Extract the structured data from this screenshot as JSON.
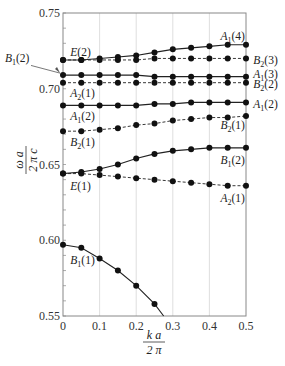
{
  "chart_data": {
    "type": "line",
    "title": "",
    "xlabel": "k a / 2 π",
    "ylabel": "ω a / 2 π c",
    "xlim": [
      0,
      0.5
    ],
    "ylim": [
      0.55,
      0.75
    ],
    "xticks": [
      0,
      0.1,
      0.2,
      0.3,
      0.4,
      0.5
    ],
    "xtick_labels": [
      "0",
      "0.1",
      "0.2",
      "0.3",
      "0.4",
      "0.5"
    ],
    "yticks": [
      0.55,
      0.6,
      0.65,
      0.7,
      0.75
    ],
    "ytick_labels": [
      "0.55",
      "0.60",
      "0.65",
      "0.70",
      "0.75"
    ],
    "grid": "vertical",
    "x": [
      0,
      0.05,
      0.1,
      0.15,
      0.2,
      0.25,
      0.3,
      0.35,
      0.4,
      0.45,
      0.5
    ],
    "series": [
      {
        "name": "A1(4)",
        "start_label": "E(2)",
        "style": "solid",
        "values": [
          0.719,
          0.719,
          0.72,
          0.721,
          0.722,
          0.724,
          0.726,
          0.727,
          0.728,
          0.729,
          0.729
        ]
      },
      {
        "name": "B2(3)",
        "style": "dashed",
        "values": [
          0.719,
          0.719,
          0.719,
          0.719,
          0.719,
          0.72,
          0.72,
          0.72,
          0.72,
          0.72,
          0.72
        ]
      },
      {
        "name": "A1(3)",
        "start_label": "B1(2)",
        "style": "solid",
        "values": [
          0.709,
          0.709,
          0.709,
          0.709,
          0.709,
          0.708,
          0.708,
          0.708,
          0.708,
          0.708,
          0.708
        ]
      },
      {
        "name": "B2(2)",
        "start_label": "A2(1)",
        "style": "dashed",
        "values": [
          0.704,
          0.704,
          0.704,
          0.704,
          0.704,
          0.704,
          0.704,
          0.704,
          0.704,
          0.704,
          0.704
        ]
      },
      {
        "name": "A1(2)",
        "start_label": "A1(2)",
        "style": "solid",
        "values": [
          0.689,
          0.689,
          0.689,
          0.689,
          0.689,
          0.69,
          0.69,
          0.691,
          0.691,
          0.691,
          0.691
        ]
      },
      {
        "name": "B2(1)",
        "start_label": "B2(1)",
        "style": "dashed",
        "values": [
          0.672,
          0.672,
          0.673,
          0.674,
          0.676,
          0.677,
          0.679,
          0.68,
          0.681,
          0.681,
          0.682
        ]
      },
      {
        "name": "B1(2)",
        "start_label": "E(1)",
        "style": "solid",
        "values": [
          0.644,
          0.645,
          0.647,
          0.65,
          0.654,
          0.657,
          0.659,
          0.66,
          0.661,
          0.661,
          0.661
        ]
      },
      {
        "name": "A2(1)",
        "style": "dashed",
        "values": [
          0.644,
          0.644,
          0.643,
          0.642,
          0.641,
          0.64,
          0.639,
          0.638,
          0.637,
          0.636,
          0.636
        ]
      },
      {
        "name": "B1(1)",
        "start_label": "B1(1)",
        "style": "solid",
        "x": [
          0,
          0.05,
          0.1,
          0.15,
          0.2,
          0.25,
          0.275
        ],
        "values": [
          0.597,
          0.595,
          0.588,
          0.58,
          0.57,
          0.558,
          0.55
        ]
      }
    ],
    "annotations": [
      {
        "text": "E(2)",
        "x": 0.02,
        "y": 0.724
      },
      {
        "text": "B1(2)",
        "x": -0.06,
        "y": 0.72,
        "arrow_to": [
          0,
          0.709
        ]
      },
      {
        "text": "A2(1)",
        "x": 0.02,
        "y": 0.697
      },
      {
        "text": "A1(2)",
        "x": 0.02,
        "y": 0.682
      },
      {
        "text": "B2(1)",
        "x": 0.02,
        "y": 0.665
      },
      {
        "text": "E(1)",
        "x": 0.02,
        "y": 0.636
      },
      {
        "text": "B1(1)",
        "x": 0.02,
        "y": 0.587
      },
      {
        "text": "A1(4)",
        "x": 0.43,
        "y": 0.735
      },
      {
        "text": "B2(3)",
        "x": 0.52,
        "y": 0.719
      },
      {
        "text": "A1(3)",
        "x": 0.52,
        "y": 0.71
      },
      {
        "text": "B2(2)",
        "x": 0.52,
        "y": 0.703
      },
      {
        "text": "A1(2)",
        "x": 0.52,
        "y": 0.69
      },
      {
        "text": "B2(1)",
        "x": 0.43,
        "y": 0.676
      },
      {
        "text": "B1(2)",
        "x": 0.43,
        "y": 0.653
      },
      {
        "text": "A2(1)",
        "x": 0.43,
        "y": 0.628
      }
    ]
  }
}
